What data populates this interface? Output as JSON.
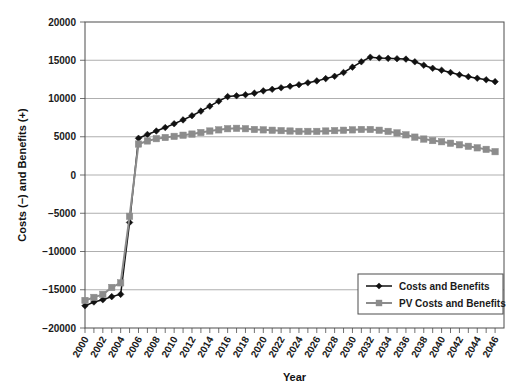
{
  "chart_data": {
    "type": "line",
    "title": "",
    "xlabel": "Year",
    "ylabel": "Costs (−) and Benefits (+)",
    "xlim": [
      2000,
      2047
    ],
    "ylim": [
      -20000,
      20000
    ],
    "grid": true,
    "legend_position": "bottom-right",
    "y_ticks": [
      20000,
      15000,
      10000,
      5000,
      0,
      -5000,
      -10000,
      -15000,
      -20000
    ],
    "y_tick_labels": [
      "20000",
      "15000",
      "10000",
      "5000",
      "0",
      "−5000",
      "−10000",
      "−15000",
      "−20000"
    ],
    "x_ticks": [
      2000,
      2001,
      2002,
      2003,
      2004,
      2005,
      2006,
      2007,
      2008,
      2009,
      2010,
      2011,
      2012,
      2013,
      2014,
      2015,
      2016,
      2017,
      2018,
      2019,
      2020,
      2021,
      2022,
      2023,
      2024,
      2025,
      2026,
      2027,
      2028,
      2029,
      2030,
      2031,
      2032,
      2033,
      2034,
      2035,
      2036,
      2037,
      2038,
      2039,
      2040,
      2041,
      2042,
      2043,
      2044,
      2045,
      2046
    ],
    "x_tick_labels": [
      "2000",
      "2002",
      "2004",
      "2006",
      "2008",
      "2010",
      "2012",
      "2014",
      "2016",
      "2018",
      "2020",
      "2022",
      "2024",
      "2026",
      "2028",
      "2030",
      "2032",
      "2034",
      "2036",
      "2038",
      "2040",
      "2042",
      "2044",
      "2046"
    ],
    "x": [
      2000,
      2001,
      2002,
      2003,
      2004,
      2005,
      2006,
      2007,
      2008,
      2009,
      2010,
      2011,
      2012,
      2013,
      2014,
      2015,
      2016,
      2017,
      2018,
      2019,
      2020,
      2021,
      2022,
      2023,
      2024,
      2025,
      2026,
      2027,
      2028,
      2029,
      2030,
      2031,
      2032,
      2033,
      2034,
      2035,
      2036,
      2037,
      2038,
      2039,
      2040,
      2041,
      2042,
      2043,
      2044,
      2045,
      2046
    ],
    "series": [
      {
        "name": "Costs and Benefits",
        "color": "#111111",
        "marker": "diamond",
        "values": [
          -17100,
          -16600,
          -16300,
          -15900,
          -15600,
          -6200,
          4800,
          5300,
          5750,
          6200,
          6700,
          7200,
          7750,
          8350,
          9000,
          9650,
          10250,
          10350,
          10500,
          10700,
          11000,
          11200,
          11400,
          11600,
          11800,
          12050,
          12300,
          12600,
          12900,
          13400,
          14100,
          14800,
          15400,
          15300,
          15250,
          15200,
          15150,
          14800,
          14350,
          13950,
          13700,
          13400,
          13100,
          12850,
          12650,
          12450,
          12200
        ]
      },
      {
        "name": "PV Costs and Benefits",
        "color": "#8c8c8c",
        "marker": "square",
        "values": [
          -16400,
          -16000,
          -15600,
          -14700,
          -14100,
          -5400,
          4050,
          4450,
          4750,
          4900,
          5050,
          5200,
          5350,
          5550,
          5750,
          5900,
          6050,
          6100,
          6050,
          5950,
          5900,
          5850,
          5800,
          5750,
          5700,
          5700,
          5700,
          5750,
          5800,
          5850,
          5900,
          5950,
          5950,
          5850,
          5700,
          5500,
          5250,
          4950,
          4700,
          4500,
          4350,
          4150,
          3950,
          3750,
          3550,
          3350,
          3050
        ]
      }
    ]
  },
  "legend": {
    "entries": [
      {
        "label": "Costs and Benefits"
      },
      {
        "label": "PV Costs and Benefits"
      }
    ]
  },
  "axes": {
    "x_title": "Year",
    "y_title": "Costs (−) and Benefits (+)"
  }
}
